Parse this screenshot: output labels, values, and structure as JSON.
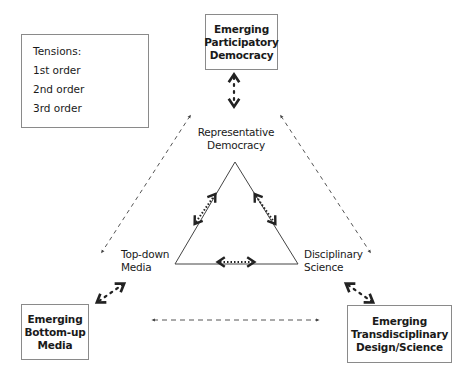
{
  "legend": {
    "title": "Tensions:",
    "items": [
      {
        "label": "1st order",
        "style": "tight-dotted double arrow"
      },
      {
        "label": "2nd order",
        "style": "dotted double arrow"
      },
      {
        "label": "3rd order",
        "style": "dashed double arrow"
      }
    ]
  },
  "triangle": {
    "top": {
      "line1": "Representative",
      "line2": "Democracy"
    },
    "left": {
      "line1": "Top-down",
      "line2": "Media"
    },
    "right": {
      "line1": "Disciplinary",
      "line2": "Science"
    }
  },
  "boxes": {
    "top": {
      "line1": "Emerging",
      "line2": "Participatory",
      "line3": "Democracy"
    },
    "bottom_left": {
      "line1": "Emerging",
      "line2": "Bottom-up",
      "line3": "Media"
    },
    "bottom_right": {
      "line1": "Emerging",
      "line2": "Transdisciplinary",
      "line3": "Design/Science"
    }
  },
  "colors": {
    "line": "#333333",
    "dashed": "#555555",
    "border": "#8a8a8a"
  }
}
